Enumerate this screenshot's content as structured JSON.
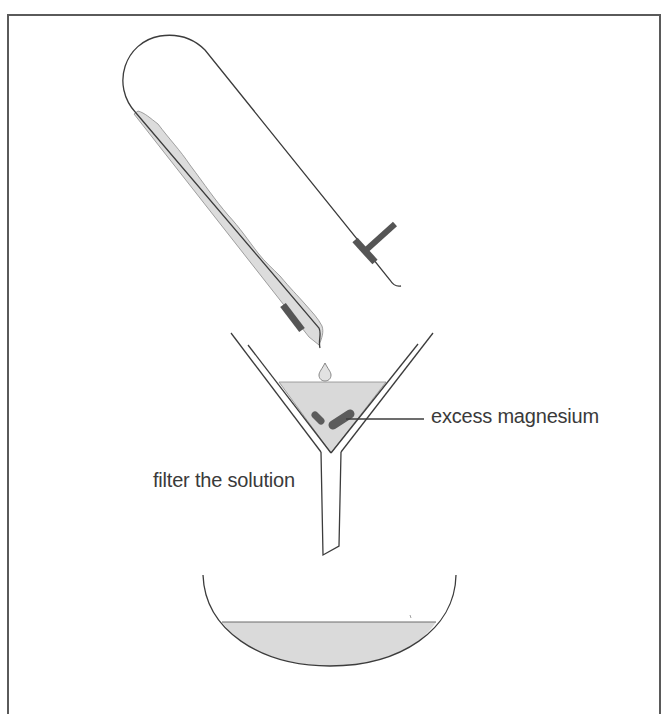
{
  "diagram": {
    "type": "lab-apparatus-illustration",
    "labels": {
      "excess_magnesium": "excess magnesium",
      "filter_the_solution": "filter the solution"
    },
    "components": [
      {
        "name": "test-tube",
        "state": "tilted, pouring solution"
      },
      {
        "name": "test-tube-holder",
        "shape": "T-clamp"
      },
      {
        "name": "filter-funnel",
        "contains": "solution with excess magnesium"
      },
      {
        "name": "evaporating-basin",
        "contains": "filtrate"
      }
    ],
    "colors": {
      "outline": "#3c3c3c",
      "liquid": "#d9d9d9",
      "clamp": "#555555",
      "magnesium": "#5c5c5c",
      "text": "#3a3a3a",
      "frame": "#5a5a5a"
    }
  }
}
